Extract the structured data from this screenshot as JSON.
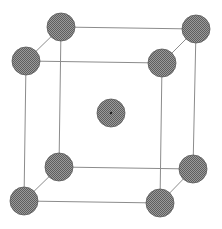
{
  "diagram": {
    "type": "bcc-unit-cell",
    "title": "",
    "colors": {
      "background": "#ffffff",
      "edge": "#8c8c8c",
      "atom_light": "#9a9a9a",
      "atom_dark": "#5e5e5e",
      "atom_outline": "#5a5a5a",
      "center_dot": "#222222"
    },
    "atom_radius": 14,
    "atoms": [
      {
        "id": "back-top-left",
        "x": 61,
        "y": 27
      },
      {
        "id": "back-top-right",
        "x": 196,
        "y": 29
      },
      {
        "id": "front-top-left",
        "x": 26,
        "y": 61
      },
      {
        "id": "front-top-right",
        "x": 162,
        "y": 63
      },
      {
        "id": "back-bottom-left",
        "x": 59,
        "y": 167
      },
      {
        "id": "back-bottom-right",
        "x": 193,
        "y": 169
      },
      {
        "id": "front-bottom-left",
        "x": 24,
        "y": 201
      },
      {
        "id": "front-bottom-right",
        "x": 160,
        "y": 203
      },
      {
        "id": "body-center",
        "x": 111,
        "y": 113
      }
    ],
    "edges": [
      [
        "back-top-left",
        "back-top-right"
      ],
      [
        "back-top-left",
        "front-top-left"
      ],
      [
        "back-top-right",
        "front-top-right"
      ],
      [
        "front-top-left",
        "front-top-right"
      ],
      [
        "back-bottom-left",
        "back-bottom-right"
      ],
      [
        "back-bottom-left",
        "front-bottom-left"
      ],
      [
        "back-bottom-right",
        "front-bottom-right"
      ],
      [
        "front-bottom-left",
        "front-bottom-right"
      ],
      [
        "back-top-left",
        "back-bottom-left"
      ],
      [
        "back-top-right",
        "back-bottom-right"
      ],
      [
        "front-top-left",
        "front-bottom-left"
      ],
      [
        "front-top-right",
        "front-bottom-right"
      ]
    ]
  }
}
